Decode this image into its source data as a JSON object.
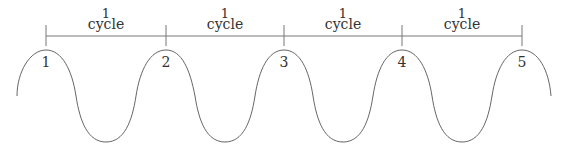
{
  "diagram": {
    "title": "",
    "colors": {
      "line": "#777777",
      "wave": "#666666",
      "text": "#333333",
      "background": "#ffffff"
    },
    "cycle_labels": [
      {
        "number": "1",
        "word": "cycle",
        "x": 106
      },
      {
        "number": "1",
        "word": "cycle",
        "x": 225
      },
      {
        "number": "1",
        "word": "cycle",
        "x": 343
      },
      {
        "number": "1",
        "word": "cycle",
        "x": 462
      }
    ],
    "ticks": [
      46,
      166,
      284,
      402,
      522
    ],
    "points": [
      {
        "label": "1",
        "x": 46
      },
      {
        "label": "2",
        "x": 166
      },
      {
        "label": "3",
        "x": 284
      },
      {
        "label": "4",
        "x": 402
      },
      {
        "label": "5",
        "x": 522
      }
    ]
  }
}
